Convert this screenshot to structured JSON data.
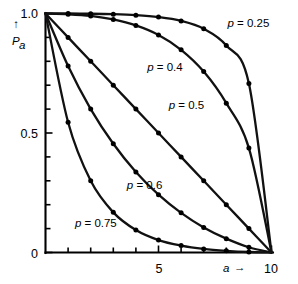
{
  "chart_data": {
    "type": "line",
    "title": "",
    "subtitle": "",
    "xlabel": "a",
    "ylabel": "P_a",
    "xlim": [
      0,
      10
    ],
    "ylim": [
      0,
      1.0
    ],
    "grid": false,
    "legend_position": "inline-annotations",
    "x_ticks_major": [
      5,
      10
    ],
    "x_tick_labels": [
      "5",
      "10"
    ],
    "x_ticks_minor": [
      1,
      2,
      3,
      4,
      6,
      7,
      8,
      9
    ],
    "y_ticks_major": [
      0,
      0.5,
      1.0
    ],
    "y_tick_labels": [
      "0",
      "0.5",
      "1.0"
    ],
    "y_ticks_minor": [
      0.1,
      0.2,
      0.3,
      0.4,
      0.6,
      0.7,
      0.8,
      0.9
    ],
    "x": [
      0,
      1,
      2,
      3,
      4,
      5,
      6,
      7,
      8,
      9,
      10
    ],
    "series": [
      {
        "name": "p = 0.25",
        "label": "p = 0.25",
        "p": 0.25,
        "values": [
          1.0,
          1.0,
          0.999,
          0.997,
          0.993,
          0.985,
          0.969,
          0.936,
          0.866,
          0.707,
          0.0
        ],
        "label_x": 8.05,
        "label_y": 0.945
      },
      {
        "name": "p = 0.4",
        "label": "p = 0.4",
        "p": 0.4,
        "values": [
          1.0,
          0.997,
          0.99,
          0.975,
          0.95,
          0.91,
          0.848,
          0.757,
          0.625,
          0.437,
          0.0
        ],
        "label_x": 4.5,
        "label_y": 0.76
      },
      {
        "name": "p = 0.5",
        "label": "p = 0.5",
        "p": 0.5,
        "values": [
          1.0,
          0.9,
          0.8,
          0.7,
          0.6,
          0.5,
          0.4,
          0.3,
          0.2,
          0.1,
          0.0
        ],
        "label_x": 5.45,
        "label_y": 0.6
      },
      {
        "name": "p = 0.6",
        "label": "p = 0.6",
        "p": 0.6,
        "values": [
          1.0,
          0.78,
          0.6,
          0.455,
          0.337,
          0.242,
          0.166,
          0.105,
          0.058,
          0.022,
          0.0
        ],
        "label_x": 3.6,
        "label_y": 0.265
      },
      {
        "name": "p = 0.75",
        "label": "p = 0.75",
        "p": 0.75,
        "values": [
          1.0,
          0.545,
          0.3,
          0.168,
          0.094,
          0.052,
          0.029,
          0.015,
          0.007,
          0.002,
          0.0
        ],
        "label_x": 1.3,
        "label_y": 0.105
      }
    ]
  },
  "axes": {
    "y_axis_symbol": "P",
    "y_axis_subscript": "a",
    "y_axis_arrow": "↑",
    "x_axis_symbol": "a",
    "x_axis_arrow": "→"
  }
}
